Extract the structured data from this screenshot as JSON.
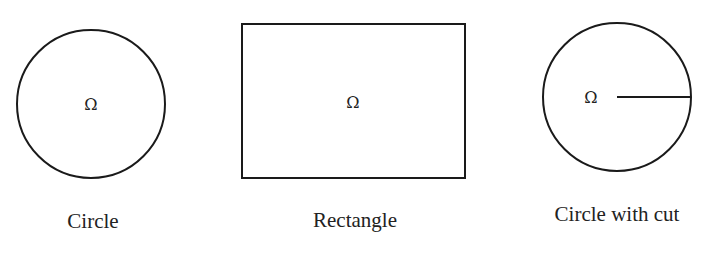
{
  "colors": {
    "stroke": "#1a1a1a",
    "text": "#222222",
    "background": "#ffffff"
  },
  "shapes": [
    {
      "type": "circle",
      "label": "Circle",
      "domain_symbol": "Ω",
      "cx": 91,
      "cy": 104,
      "r": 74
    },
    {
      "type": "rectangle",
      "label": "Rectangle",
      "domain_symbol": "Ω",
      "x": 242,
      "y": 24,
      "width": 223,
      "height": 154
    },
    {
      "type": "circle-with-cut",
      "label": "Circle with cut",
      "domain_symbol": "Ω",
      "cx": 617,
      "cy": 97,
      "r": 74,
      "cut": {
        "x1": 617,
        "y1": 97,
        "x2": 691,
        "y2": 97
      }
    }
  ]
}
